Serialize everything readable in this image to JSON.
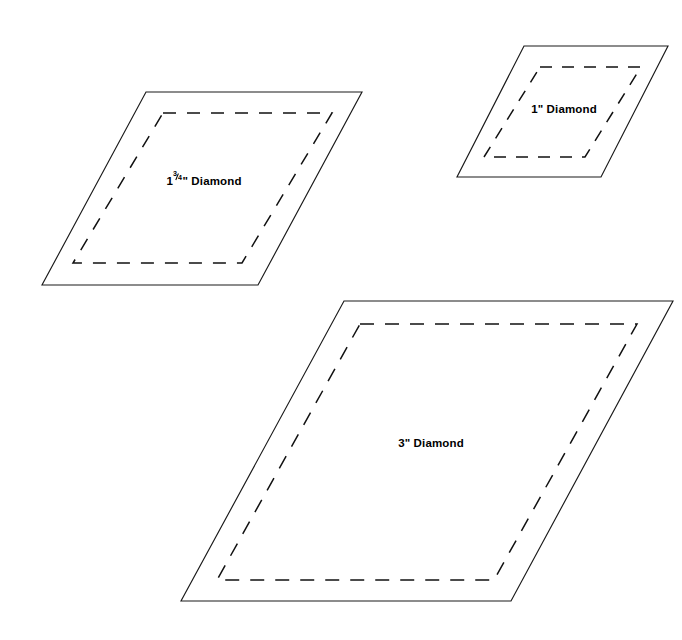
{
  "page": {
    "background_color": "#ffffff",
    "width": 682,
    "height": 640,
    "stroke_color": "#1a1a1a",
    "dash_color": "#111111",
    "text_color": "#000000"
  },
  "shapes": [
    {
      "id": "diamond-1-3-4",
      "label_plain": "1¾\" Diamond",
      "label_whole": "1",
      "label_numerator": "3",
      "label_denominator": "4",
      "label_suffix": "\" Diamond",
      "size_inches": "1 3/4",
      "label_x": 204,
      "label_y": 180,
      "label_font_size": 11.5,
      "outline_points": "146,92 362,92 258,285 42,285",
      "seam_points": "163,113 332,113 242,263 73,263",
      "seam_dash": "13 11"
    },
    {
      "id": "diamond-1",
      "label_plain": "1\" Diamond",
      "label_whole": "1",
      "label_numerator": "",
      "label_denominator": "",
      "label_suffix": "\" Diamond",
      "size_inches": "1",
      "label_x": 564,
      "label_y": 110,
      "label_font_size": 11.5,
      "outline_points": "524,46 668,46 601,177 457,177",
      "seam_points": "540,67 641,67 585,157 484,157",
      "seam_dash": "12 10"
    },
    {
      "id": "diamond-3",
      "label_plain": "3\" Diamond",
      "label_whole": "3",
      "label_numerator": "",
      "label_denominator": "",
      "label_suffix": "\" Diamond",
      "size_inches": "3",
      "label_x": 431,
      "label_y": 444,
      "label_font_size": 11.5,
      "outline_points": "344,301 673,301 511,601 181,601",
      "seam_points": "360,324 637,324 494,580 217,580",
      "seam_dash": "14 11"
    }
  ]
}
